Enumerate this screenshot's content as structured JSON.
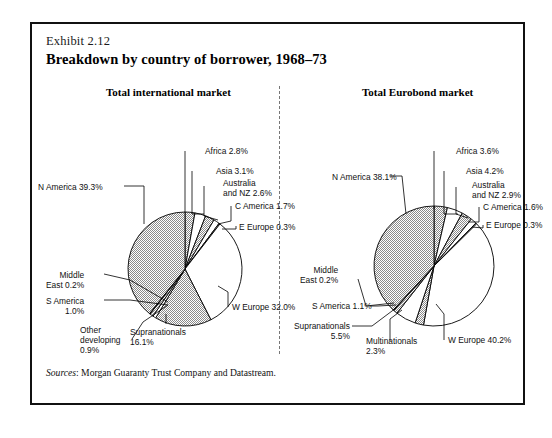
{
  "exhibit": "Exhibit 2.12",
  "title": "Breakdown by country of borrower, 1968–73",
  "sources_label": "Sources",
  "sources_text": ": Morgan Guaranty Trust Company and Datastream.",
  "colors": {
    "hatch": "#8f8f8f",
    "white": "#ffffff",
    "outline": "#000000",
    "border": "#111111",
    "divider": "#777777"
  },
  "chart_data": [
    {
      "type": "pie",
      "title": "Total international market",
      "unit": "%",
      "start_angle_deg": 0,
      "direction": "clockwise",
      "categories": [
        "Africa",
        "Asia",
        "Australia and NZ",
        "C America",
        "E Europe",
        "W Europe",
        "Supranationals",
        "Other developing",
        "S America",
        "Middle East",
        "N America"
      ],
      "values": [
        2.8,
        3.1,
        2.6,
        1.7,
        0.3,
        32.0,
        16.1,
        0.9,
        1.0,
        0.2,
        39.3
      ],
      "fills": [
        "hatch",
        "white",
        "hatch",
        "white",
        "hatch",
        "white",
        "hatch",
        "white",
        "hatch",
        "white",
        "hatch"
      ],
      "labels": [
        "Africa 2.8%",
        "Asia 3.1%",
        "Australia\nand NZ 2.6%",
        "C America 1.7%",
        "E Europe 0.3%",
        "W Europe 32.0%",
        "Supranationals\n16.1%",
        "Other\ndeveloping\n0.9%",
        "S America\n1.0%",
        "Middle\nEast 0.2%",
        "N America 39.3%"
      ]
    },
    {
      "type": "pie",
      "title": "Total Eurobond market",
      "unit": "%",
      "start_angle_deg": 0,
      "direction": "clockwise",
      "categories": [
        "Africa",
        "Asia",
        "Australia and NZ",
        "C America",
        "E Europe",
        "W Europe",
        "Multinationals",
        "Supranationals",
        "S America",
        "Middle East",
        "N America"
      ],
      "values": [
        3.6,
        4.2,
        2.9,
        1.6,
        0.3,
        40.2,
        2.3,
        5.5,
        1.1,
        0.2,
        38.1
      ],
      "fills": [
        "hatch",
        "white",
        "hatch",
        "white",
        "hatch",
        "white",
        "hatch",
        "white",
        "hatch",
        "white",
        "hatch"
      ],
      "labels": [
        "Africa 3.6%",
        "Asia 4.2%",
        "Australia\nand NZ 2.9%",
        "C America 1.6%",
        "E Europe 0.3%",
        "W Europe 40.2%",
        "Multinationals\n2.3%",
        "Supranationals\n5.5%",
        "S America 1.1%",
        "Middle\nEast 0.2%",
        "N America 38.1%"
      ]
    }
  ],
  "panels": [
    {
      "title_left": 80,
      "title_top": 62
    },
    {
      "title_left": 330,
      "title_top": 62
    }
  ]
}
